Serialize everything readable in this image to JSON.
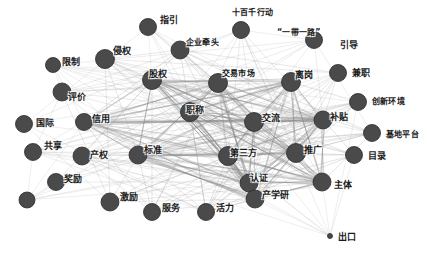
{
  "figure": {
    "type": "network-graph",
    "title": "",
    "background_color": "#ffffff",
    "node_color": "#4a4a4a",
    "node_stroke_color": "#2b2b2b",
    "edge_color": "#8c8c8c",
    "label_color": "#1a1a1a",
    "node_count": 34,
    "layout": "force-directed"
  },
  "chart_data": {
    "type": "scatter",
    "title": "",
    "xlabel": "",
    "ylabel": "",
    "grid": false,
    "legend": "none",
    "nodes": [
      {
        "id": "zhiyin",
        "label": "指引",
        "x": 148,
        "y": 27,
        "r": 8.5,
        "lx": 160,
        "ly": 15
      },
      {
        "id": "shibaiqian",
        "label": "十百千行动",
        "x": 241,
        "y": 30,
        "r": 8.5,
        "lx": 232,
        "ly": 8
      },
      {
        "id": "yidaiyilu",
        "label": "“一带一路”",
        "x": 314,
        "y": 40,
        "r": 8.5,
        "lx": 277,
        "ly": 28
      },
      {
        "id": "qiyeqiantou",
        "label": "企业牵头",
        "x": 180,
        "y": 50,
        "r": 9.0,
        "lx": 186,
        "ly": 38
      },
      {
        "id": "yindao",
        "label": "引导",
        "x": 314,
        "y": 40,
        "r": 0.1,
        "lx": 340,
        "ly": 40
      },
      {
        "id": "qinquan",
        "label": "侵权",
        "x": 105,
        "y": 59,
        "r": 9.5,
        "lx": 113,
        "ly": 46
      },
      {
        "id": "xianzhi",
        "label": "限制",
        "x": 53,
        "y": 65,
        "r": 7.5,
        "lx": 62,
        "ly": 57
      },
      {
        "id": "guquan",
        "label": "股权",
        "x": 152,
        "y": 80,
        "r": 9.5,
        "lx": 149,
        "ly": 69
      },
      {
        "id": "jiaoyishichang",
        "label": "交易市场",
        "x": 218,
        "y": 83,
        "r": 9.5,
        "lx": 222,
        "ly": 69
      },
      {
        "id": "ligang",
        "label": "离岗",
        "x": 291,
        "y": 82,
        "r": 9.5,
        "lx": 295,
        "ly": 70
      },
      {
        "id": "jianzhi",
        "label": "兼职",
        "x": 338,
        "y": 73,
        "r": 8.5,
        "lx": 352,
        "ly": 68
      },
      {
        "id": "pingjia",
        "label": "评价",
        "x": 62,
        "y": 92,
        "r": 9.0,
        "lx": 68,
        "ly": 92
      },
      {
        "id": "chuangxin",
        "label": "创新环境",
        "x": 358,
        "y": 102,
        "r": 8.5,
        "lx": 372,
        "ly": 97
      },
      {
        "id": "guoji",
        "label": "国际",
        "x": 24,
        "y": 124,
        "r": 8.5,
        "lx": 36,
        "ly": 118
      },
      {
        "id": "xinyong",
        "label": "信用",
        "x": 84,
        "y": 122,
        "r": 8.5,
        "lx": 92,
        "ly": 114
      },
      {
        "id": "zhicheng",
        "label": "职称",
        "x": 190,
        "y": 112,
        "r": 9.5,
        "lx": 186,
        "ly": 105
      },
      {
        "id": "jiaoliu",
        "label": "交流",
        "x": 254,
        "y": 122,
        "r": 9.5,
        "lx": 262,
        "ly": 113
      },
      {
        "id": "butie",
        "label": "补贴",
        "x": 323,
        "y": 120,
        "r": 9.0,
        "lx": 330,
        "ly": 112
      },
      {
        "id": "jidipingtai",
        "label": "基地平台",
        "x": 372,
        "y": 133,
        "r": 8.5,
        "lx": 386,
        "ly": 130
      },
      {
        "id": "gongxiang",
        "label": "共享",
        "x": 33,
        "y": 152,
        "r": 8.5,
        "lx": 44,
        "ly": 141
      },
      {
        "id": "chanquan",
        "label": "产权",
        "x": 82,
        "y": 156,
        "r": 9.0,
        "lx": 90,
        "ly": 150
      },
      {
        "id": "biaozhun",
        "label": "标准",
        "x": 138,
        "y": 155,
        "r": 9.0,
        "lx": 144,
        "ly": 145
      },
      {
        "id": "disanfang",
        "label": "第三方",
        "x": 228,
        "y": 156,
        "r": 9.5,
        "lx": 230,
        "ly": 148
      },
      {
        "id": "tuiguang",
        "label": "推广",
        "x": 296,
        "y": 153,
        "r": 9.5,
        "lx": 304,
        "ly": 145
      },
      {
        "id": "mulu",
        "label": "目录",
        "x": 354,
        "y": 155,
        "r": 8.5,
        "lx": 368,
        "ly": 151
      },
      {
        "id": "jiangli",
        "label": "奖励",
        "x": 56,
        "y": 182,
        "r": 8.5,
        "lx": 64,
        "ly": 174
      },
      {
        "id": "renzheng",
        "label": "认证",
        "x": 249,
        "y": 183,
        "r": 9.0,
        "lx": 250,
        "ly": 173
      },
      {
        "id": "zhuti",
        "label": "主体",
        "x": 322,
        "y": 182,
        "r": 9.0,
        "lx": 334,
        "ly": 180
      },
      {
        "id": "jili",
        "label": "激励",
        "x": 110,
        "y": 202,
        "r": 9.0,
        "lx": 120,
        "ly": 192
      },
      {
        "id": "fuwu",
        "label": "服务",
        "x": 152,
        "y": 212,
        "r": 8.5,
        "lx": 162,
        "ly": 203
      },
      {
        "id": "huoli",
        "label": "活力",
        "x": 206,
        "y": 212,
        "r": 8.5,
        "lx": 216,
        "ly": 203
      },
      {
        "id": "chanxueyan",
        "label": "产学研",
        "x": 255,
        "y": 199,
        "r": 9.0,
        "lx": 262,
        "ly": 190
      },
      {
        "id": "chukou",
        "label": "出口",
        "x": 330,
        "y": 236,
        "r": 2.5,
        "lx": 338,
        "ly": 232
      },
      {
        "id": "zuoxia",
        "label": "",
        "x": 27,
        "y": 200,
        "r": 8.0,
        "lx": 0,
        "ly": 0
      }
    ],
    "edges_note": "dense force-directed mesh; core nodes fully interconnected, peripheral nodes connect inward"
  }
}
